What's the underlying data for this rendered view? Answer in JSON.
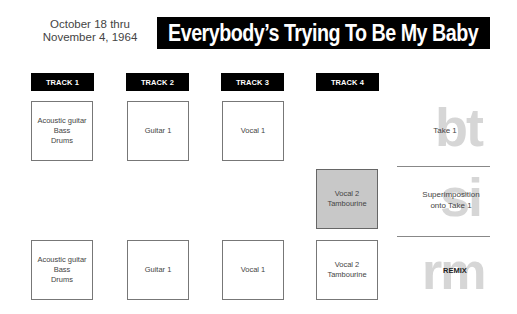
{
  "header": {
    "date_lines": [
      "October 18 thru",
      "November 4, 1964"
    ],
    "title": "Everybody’s Trying To Be My Baby"
  },
  "tracks": [
    {
      "label": "TRACK 1"
    },
    {
      "label": "TRACK 2"
    },
    {
      "label": "TRACK 3"
    },
    {
      "label": "TRACK 4"
    }
  ],
  "rows": [
    {
      "name": "take-1",
      "watermark": "bt",
      "label": "Take 1",
      "cells": [
        {
          "lines": [
            "Acoustic guitar",
            "Bass",
            "Drums"
          ]
        },
        {
          "lines": [
            "Guitar 1"
          ]
        },
        {
          "lines": [
            "Vocal 1"
          ]
        },
        null
      ]
    },
    {
      "name": "superimposition",
      "watermark": "si",
      "label_lines": [
        "Superimposition",
        "onto Take 1"
      ],
      "cells": [
        null,
        null,
        null,
        {
          "lines": [
            "Vocal 2",
            "Tambourine"
          ],
          "highlight": true
        }
      ]
    },
    {
      "name": "remix",
      "watermark": "rm",
      "label": "REMIX",
      "cells": [
        {
          "lines": [
            "Acoustic guitar",
            "Bass",
            "Drums"
          ]
        },
        {
          "lines": [
            "Guitar 1"
          ]
        },
        {
          "lines": [
            "Vocal 1"
          ]
        },
        {
          "lines": [
            "Vocal 2",
            "Tambourine"
          ]
        }
      ]
    }
  ],
  "colors": {
    "header_bg": "#000000",
    "header_text": "#ffffff",
    "highlight_box": "#c8c8c8",
    "watermark": "#d6d6d6",
    "divider": "#888888"
  }
}
